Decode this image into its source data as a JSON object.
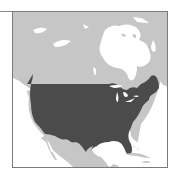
{
  "map": {
    "type": "locator-map",
    "highlighted_region": "United States (contiguous)",
    "context_region": "North America",
    "colors": {
      "water": "#ffffff",
      "land": "#c6c6c6",
      "highlight": "#4b4b4b",
      "border": "#7a7a7a",
      "coastline": "#9a9a9a"
    },
    "features": [
      "canada",
      "hudson-bay",
      "united-states",
      "great-lakes",
      "mexico",
      "gulf-of-mexico",
      "caribbean-islands",
      "arctic-islands"
    ]
  }
}
